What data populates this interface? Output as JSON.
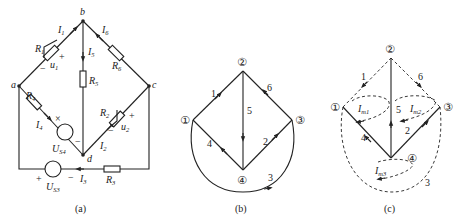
{
  "panels": [
    {
      "caption": "(a)",
      "nodes": {
        "a": "a",
        "b": "b",
        "c": "c",
        "d": "d"
      },
      "resistors": [
        "R1",
        "R2",
        "R3",
        "R4",
        "R5",
        "R6"
      ],
      "currents": [
        "I1",
        "I2",
        "I3",
        "I4",
        "I5",
        "I6"
      ],
      "voltages": {
        "u1": "u1",
        "u2": "u2"
      },
      "sources": {
        "US4": "US4",
        "US3": "US3"
      },
      "labels": {
        "R1": "R",
        "R1s": "1",
        "R2": "R",
        "R2s": "2",
        "R3": "R",
        "R3s": "3",
        "R4": "R",
        "R4s": "4",
        "R5": "R",
        "R5s": "5",
        "R6": "R",
        "R6s": "6",
        "I1": "I",
        "I1s": "1",
        "I2": "I",
        "I2s": "2",
        "I3": "I",
        "I3s": "3",
        "I4": "I",
        "I4s": "4",
        "I5": "I",
        "I5s": "5",
        "I6": "I",
        "I6s": "6",
        "u1": "u",
        "u1s": "1",
        "u2": "u",
        "u2s": "2",
        "US4": "U",
        "US4s": "S4",
        "US3": "U",
        "US3s": "S3",
        "plus": "+",
        "minus": "−",
        "cross": "×",
        "a": "a",
        "b": "b",
        "c": "c",
        "d": "d"
      }
    },
    {
      "caption": "(b)",
      "nodes": [
        "①",
        "②",
        "③",
        "④"
      ],
      "branches": [
        {
          "id": "1",
          "from": "①",
          "to": "②"
        },
        {
          "id": "2",
          "from": "④",
          "to": "③"
        },
        {
          "id": "3",
          "from": "①",
          "to": "③"
        },
        {
          "id": "4",
          "from": "④",
          "to": "①"
        },
        {
          "id": "5",
          "from": "②",
          "to": "④"
        },
        {
          "id": "6",
          "from": "③",
          "to": "②"
        }
      ]
    },
    {
      "caption": "(c)",
      "nodes": [
        "①",
        "②",
        "③",
        "④"
      ],
      "tree_branches": [
        "2",
        "4",
        "5"
      ],
      "link_branches": [
        "1",
        "3",
        "6"
      ],
      "mesh_currents": {
        "m1": "I",
        "m1s": "m1",
        "m2": "I",
        "m2s": "m2",
        "m3": "I",
        "m3s": "m3"
      },
      "branch_labels": [
        "1",
        "2",
        "3",
        "4",
        "5",
        "6"
      ]
    }
  ]
}
